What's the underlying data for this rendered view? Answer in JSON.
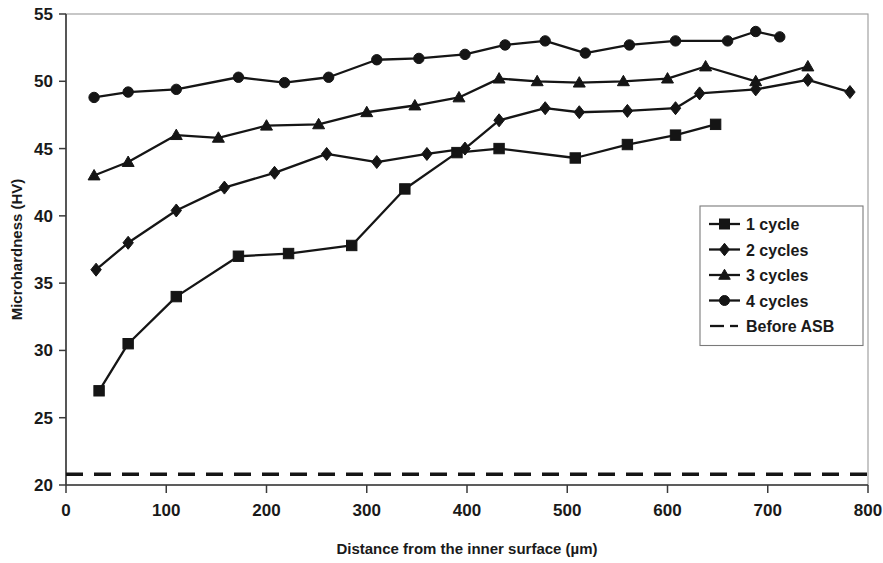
{
  "chart_data": {
    "type": "line",
    "title": "",
    "xlabel": "Distance from the inner surface (µm)",
    "ylabel": "Microhardness (HV)",
    "xlim": [
      0,
      800
    ],
    "ylim": [
      20,
      55
    ],
    "xticks": [
      0,
      100,
      200,
      300,
      400,
      500,
      600,
      700,
      800
    ],
    "yticks": [
      20,
      25,
      30,
      35,
      40,
      45,
      50,
      55
    ],
    "xtick_labels": [
      "0",
      "100",
      "200",
      "300",
      "400",
      "500",
      "600",
      "700",
      "800"
    ],
    "ytick_labels": [
      "20",
      "25",
      "30",
      "35",
      "40",
      "45",
      "50",
      "55"
    ],
    "grid": false,
    "legend_position": "right-middle",
    "series": [
      {
        "name": "1 cycle",
        "marker": "square",
        "linestyle": "solid",
        "color": "#151515",
        "points": [
          [
            33,
            27.0
          ],
          [
            62,
            30.5
          ],
          [
            110,
            34.0
          ],
          [
            172,
            37.0
          ],
          [
            222,
            37.2
          ],
          [
            285,
            37.8
          ],
          [
            338,
            42.0
          ],
          [
            390,
            44.7
          ],
          [
            432,
            45.0
          ],
          [
            508,
            44.3
          ],
          [
            560,
            45.3
          ],
          [
            608,
            46.0
          ],
          [
            648,
            46.8
          ]
        ]
      },
      {
        "name": "2 cycles",
        "marker": "diamond",
        "linestyle": "solid",
        "color": "#151515",
        "points": [
          [
            30,
            36.0
          ],
          [
            62,
            38.0
          ],
          [
            110,
            40.4
          ],
          [
            158,
            42.1
          ],
          [
            208,
            43.2
          ],
          [
            260,
            44.6
          ],
          [
            310,
            44.0
          ],
          [
            360,
            44.6
          ],
          [
            398,
            45.0
          ],
          [
            432,
            47.1
          ],
          [
            478,
            48.0
          ],
          [
            512,
            47.7
          ],
          [
            560,
            47.8
          ],
          [
            608,
            48.0
          ],
          [
            632,
            49.1
          ],
          [
            688,
            49.4
          ],
          [
            740,
            50.1
          ],
          [
            782,
            49.2
          ]
        ]
      },
      {
        "name": "3 cycles",
        "marker": "triangle",
        "linestyle": "solid",
        "color": "#151515",
        "points": [
          [
            28,
            43.0
          ],
          [
            62,
            44.0
          ],
          [
            110,
            46.0
          ],
          [
            152,
            45.8
          ],
          [
            200,
            46.7
          ],
          [
            252,
            46.8
          ],
          [
            300,
            47.7
          ],
          [
            348,
            48.2
          ],
          [
            392,
            48.8
          ],
          [
            432,
            50.2
          ],
          [
            470,
            50.0
          ],
          [
            512,
            49.9
          ],
          [
            556,
            50.0
          ],
          [
            600,
            50.2
          ],
          [
            638,
            51.1
          ],
          [
            688,
            50.0
          ],
          [
            740,
            51.1
          ]
        ]
      },
      {
        "name": "4 cycles",
        "marker": "circle",
        "linestyle": "solid",
        "color": "#151515",
        "points": [
          [
            28,
            48.8
          ],
          [
            62,
            49.2
          ],
          [
            110,
            49.4
          ],
          [
            172,
            50.3
          ],
          [
            218,
            49.9
          ],
          [
            262,
            50.3
          ],
          [
            310,
            51.6
          ],
          [
            352,
            51.7
          ],
          [
            398,
            52.0
          ],
          [
            438,
            52.7
          ],
          [
            478,
            53.0
          ],
          [
            518,
            52.1
          ],
          [
            562,
            52.7
          ],
          [
            608,
            53.0
          ],
          [
            660,
            53.0
          ],
          [
            688,
            53.7
          ],
          [
            712,
            53.3
          ]
        ]
      },
      {
        "name": "Before ASB",
        "marker": "none",
        "linestyle": "dashed",
        "color": "#151515",
        "constant_value": 20.8,
        "points": [
          [
            0,
            20.8
          ],
          [
            800,
            20.8
          ]
        ]
      }
    ],
    "legend_entries": [
      {
        "label": "1 cycle",
        "marker": "square"
      },
      {
        "label": "2 cycles",
        "marker": "diamond"
      },
      {
        "label": "3 cycles",
        "marker": "triangle"
      },
      {
        "label": "4 cycles",
        "marker": "circle"
      },
      {
        "label": "Before ASB",
        "marker": "dashed"
      }
    ]
  }
}
